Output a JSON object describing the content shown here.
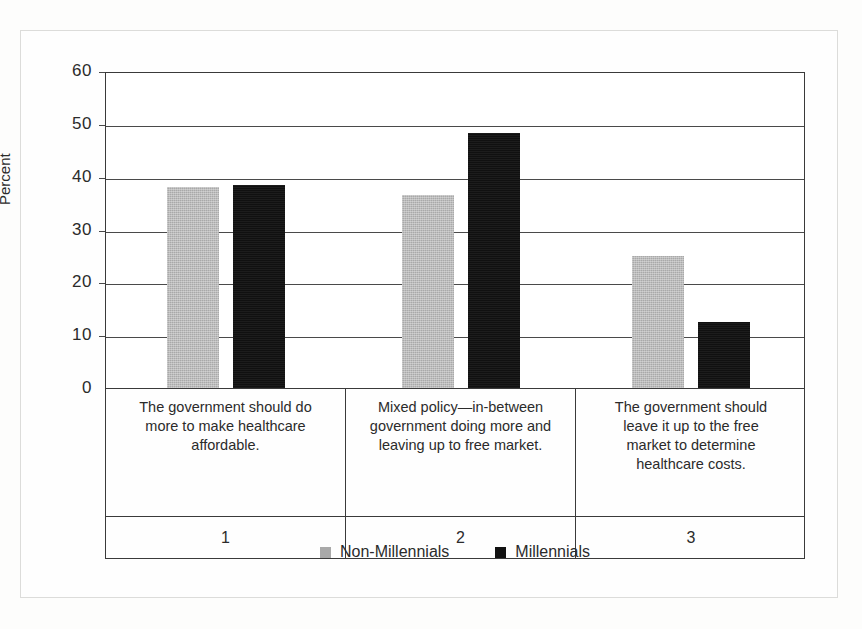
{
  "chart_data": {
    "type": "bar",
    "title": "",
    "xlabel": "",
    "ylabel": "Percent",
    "ylim": [
      0,
      60
    ],
    "yticks": [
      0,
      10,
      20,
      30,
      40,
      50,
      60
    ],
    "ytick_labels": [
      "0",
      "10",
      "20",
      "30",
      "40",
      "50",
      "60"
    ],
    "grid": true,
    "legend_position": "bottom-center",
    "categories": [
      "The government should do more to make healthcare affordable.",
      "Mixed policy—in-between government doing more and leaving up to free market.",
      "The government should leave it up to the free market to determine healthcare costs."
    ],
    "category_numbers": [
      "1",
      "2",
      "3"
    ],
    "series": [
      {
        "name": "Non-Millennials",
        "color": "#a9a9a9",
        "values": [
          38.0,
          36.5,
          25.0
        ]
      },
      {
        "name": "Millennials",
        "color": "#111111",
        "values": [
          38.5,
          48.3,
          12.5
        ]
      }
    ]
  },
  "axis": {
    "y_title": "Percent"
  },
  "categories_wrapped": [
    [
      "The government should do",
      "more to make healthcare",
      "affordable."
    ],
    [
      "Mixed policy—in-between",
      "government doing more and",
      "leaving up to free market."
    ],
    [
      "The government should",
      "leave it up to the free",
      "market to determine",
      "healthcare costs."
    ]
  ],
  "legend": {
    "entries": [
      {
        "label": "Non-Millennials",
        "color": "#a9a9a9"
      },
      {
        "label": "Millennials",
        "color": "#111111"
      }
    ]
  }
}
